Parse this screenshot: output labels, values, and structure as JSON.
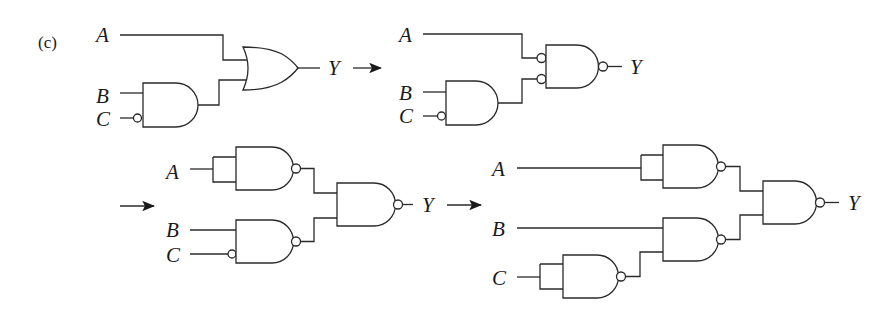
{
  "figure": {
    "part_label": "(c)",
    "stroke_color": "#2a2a2a"
  },
  "steps": [
    {
      "id": 1,
      "gates": [
        "AND (B, C inverted)",
        "OR"
      ],
      "inputs": {
        "a": "A",
        "b": "B",
        "c": "C"
      },
      "output": "Y"
    },
    {
      "id": 2,
      "gates": [
        "AND (B, C inverted)",
        "NAND with inverted inputs"
      ],
      "inputs": {
        "a": "A",
        "b": "B",
        "c": "C"
      },
      "output": "Y"
    },
    {
      "id": 3,
      "gates": [
        "NAND (A, A)",
        "NAND (B, C inverted)",
        "NAND"
      ],
      "inputs": {
        "a": "A",
        "b": "B",
        "c": "C"
      },
      "output": "Y"
    },
    {
      "id": 4,
      "gates": [
        "NAND (A, A)",
        "NAND (C, C)",
        "NAND (B, C')",
        "NAND"
      ],
      "inputs": {
        "a": "A",
        "b": "B",
        "c": "C"
      },
      "output": "Y"
    }
  ]
}
